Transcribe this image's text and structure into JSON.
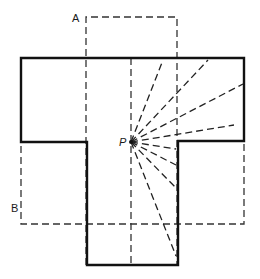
{
  "diagram": {
    "type": "floor-plan-visibility",
    "labels": {
      "a": "A",
      "b": "B",
      "p": "P"
    },
    "colors": {
      "outline": "#111111",
      "dashed": "#333333",
      "background": "#ffffff"
    },
    "outline_shape": "cross / T-shaped room (solid thick border)",
    "rectangle_a": "vertical dashed rectangle labeled A",
    "rectangle_b": "horizontal dashed rectangle labeled B",
    "viewpoint": "point P with dashed sight rays radiating to room walls",
    "ray_count": 8
  }
}
